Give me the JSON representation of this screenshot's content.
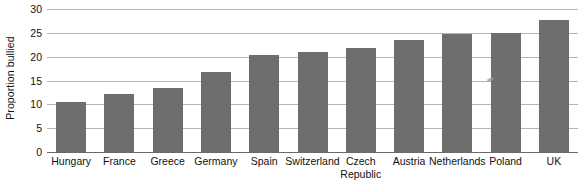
{
  "chart_data": {
    "type": "bar",
    "title": "",
    "xlabel": "",
    "ylabel": "Proportion bullied",
    "ylim": [
      0,
      30
    ],
    "ytick_step": 5,
    "yticks": [
      "0",
      "5",
      "10",
      "15",
      "20",
      "25",
      "30"
    ],
    "grid": true,
    "legend": "none",
    "bar_color": "#6e6e6e",
    "gridline_color": "#b5b5b5",
    "axis_color": "#6a6a6a",
    "categories": [
      "Hungary",
      "France",
      "Greece",
      "Germany",
      "Spain",
      "Switzerland",
      "Czech\nRepublic",
      "Austria",
      "Netherlands",
      "Poland",
      "UK"
    ],
    "values": [
      10.5,
      12.1,
      13.5,
      16.7,
      20.4,
      20.9,
      21.9,
      23.6,
      24.7,
      25.0,
      27.7
    ]
  }
}
